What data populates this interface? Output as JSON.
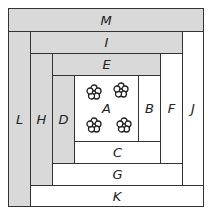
{
  "diagram": {
    "type": "log-cabin-quilt-block",
    "colors": {
      "shaded": "#d9d9d9",
      "light": "#ffffff",
      "outline": "#333333"
    },
    "pieces": [
      {
        "id": "M",
        "label": "M",
        "shade": "gray",
        "x": 8,
        "y": 8,
        "w": 196,
        "h": 23
      },
      {
        "id": "L",
        "label": "L",
        "shade": "gray",
        "x": 8,
        "y": 31,
        "w": 22,
        "h": 176
      },
      {
        "id": "I",
        "label": "I",
        "shade": "gray",
        "x": 30,
        "y": 31,
        "w": 152,
        "h": 22
      },
      {
        "id": "J",
        "label": "J",
        "shade": "white",
        "x": 182,
        "y": 31,
        "w": 22,
        "h": 154
      },
      {
        "id": "K",
        "label": "K",
        "shade": "white",
        "x": 30,
        "y": 185,
        "w": 174,
        "h": 22
      },
      {
        "id": "H",
        "label": "H",
        "shade": "gray",
        "x": 30,
        "y": 53,
        "w": 22,
        "h": 132
      },
      {
        "id": "E",
        "label": "E",
        "shade": "gray",
        "x": 52,
        "y": 53,
        "w": 108,
        "h": 22
      },
      {
        "id": "F",
        "label": "F",
        "shade": "white",
        "x": 160,
        "y": 53,
        "w": 22,
        "h": 110
      },
      {
        "id": "G",
        "label": "G",
        "shade": "white",
        "x": 52,
        "y": 163,
        "w": 130,
        "h": 22
      },
      {
        "id": "D",
        "label": "D",
        "shade": "gray",
        "x": 52,
        "y": 75,
        "w": 22,
        "h": 88
      },
      {
        "id": "B",
        "label": "B",
        "shade": "white",
        "x": 138,
        "y": 75,
        "w": 22,
        "h": 66
      },
      {
        "id": "C",
        "label": "C",
        "shade": "white",
        "x": 74,
        "y": 141,
        "w": 86,
        "h": 22
      },
      {
        "id": "A",
        "label": "A",
        "shade": "white",
        "x": 74,
        "y": 75,
        "w": 64,
        "h": 66
      }
    ],
    "center_motif": "flower-icon",
    "flower_count": 4
  }
}
